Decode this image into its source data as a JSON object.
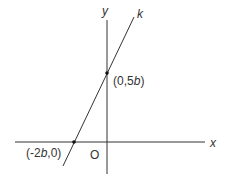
{
  "diagram": {
    "type": "coordinate-plane",
    "axes": {
      "x_label": "x",
      "y_label": "y",
      "origin_label": "O"
    },
    "line": {
      "label": "k"
    },
    "points": [
      {
        "name": "y-intercept",
        "pre": "(0,5",
        "var": "b",
        "post": ")"
      },
      {
        "name": "x-intercept",
        "pre": "(-2",
        "var": "b",
        "post": ",0)"
      }
    ],
    "colors": {
      "stroke": "#333333",
      "background": "#ffffff"
    }
  }
}
